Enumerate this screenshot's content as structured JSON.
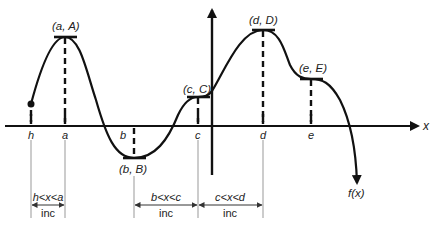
{
  "diagram": {
    "axis_labels": {
      "x": "x"
    },
    "function_label": "f(x)",
    "x_ticks": [
      {
        "name": "h",
        "label": "h",
        "x": 31
      },
      {
        "name": "a",
        "label": "a",
        "x": 65
      },
      {
        "name": "b",
        "label": "b",
        "x": 134
      },
      {
        "name": "c",
        "label": "c",
        "x": 198
      },
      {
        "name": "d",
        "label": "d",
        "x": 263
      },
      {
        "name": "e",
        "label": "e",
        "x": 311
      }
    ],
    "critical_points": [
      {
        "name": "a",
        "label": "(a, A)",
        "type": "local-max"
      },
      {
        "name": "b",
        "label": "(b, B)",
        "type": "local-min"
      },
      {
        "name": "c",
        "label": "(c, C)",
        "type": "horizontal-tangent"
      },
      {
        "name": "d",
        "label": "(d, D)",
        "type": "local-max"
      },
      {
        "name": "e",
        "label": "(e, E)",
        "type": "horizontal-tangent"
      }
    ],
    "intervals": [
      {
        "range": "h<x<a",
        "behavior": "inc"
      },
      {
        "range": "b<x<c",
        "behavior": "inc"
      },
      {
        "range": "c<x<d",
        "behavior": "inc"
      }
    ],
    "colors": {
      "ink": "#111111",
      "thin": "#888888",
      "background": "#ffffff"
    }
  }
}
